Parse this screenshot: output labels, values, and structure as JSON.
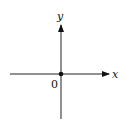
{
  "diagram": {
    "type": "cartesian-axes",
    "x_axis_label": "x",
    "y_axis_label": "y",
    "origin_label": "0",
    "origin_point": true,
    "colors": {
      "line": "#111111",
      "background": "#ffffff"
    }
  }
}
